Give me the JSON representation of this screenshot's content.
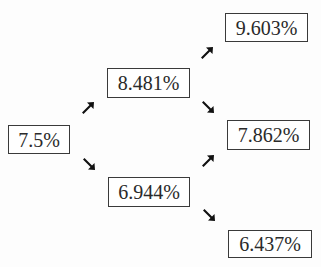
{
  "diagram": {
    "type": "binomial-interest-rate-tree",
    "nodes": [
      {
        "id": "n0",
        "label": "7.5%",
        "period": 0,
        "state": "root"
      },
      {
        "id": "n1u",
        "label": "8.481%",
        "period": 1,
        "state": "up"
      },
      {
        "id": "n1d",
        "label": "6.944%",
        "period": 1,
        "state": "down"
      },
      {
        "id": "n2uu",
        "label": "9.603%",
        "period": 2,
        "state": "up-up"
      },
      {
        "id": "n2ud",
        "label": "7.862%",
        "period": 2,
        "state": "up-down"
      },
      {
        "id": "n2dd",
        "label": "6.437%",
        "period": 2,
        "state": "down-down"
      }
    ],
    "edges": [
      {
        "from": "n0",
        "to": "n1u",
        "direction": "up-right"
      },
      {
        "from": "n0",
        "to": "n1d",
        "direction": "down-right"
      },
      {
        "from": "n1u",
        "to": "n2uu",
        "direction": "up-right"
      },
      {
        "from": "n1u",
        "to": "n2ud",
        "direction": "down-right"
      },
      {
        "from": "n1d",
        "to": "n2ud",
        "direction": "up-right"
      },
      {
        "from": "n1d",
        "to": "n2dd",
        "direction": "down-right"
      }
    ],
    "colors": {
      "box_border": "#3a3a3a",
      "text": "#2a2a2a",
      "arrow": "#111111",
      "background": "#fdfdfd"
    }
  }
}
